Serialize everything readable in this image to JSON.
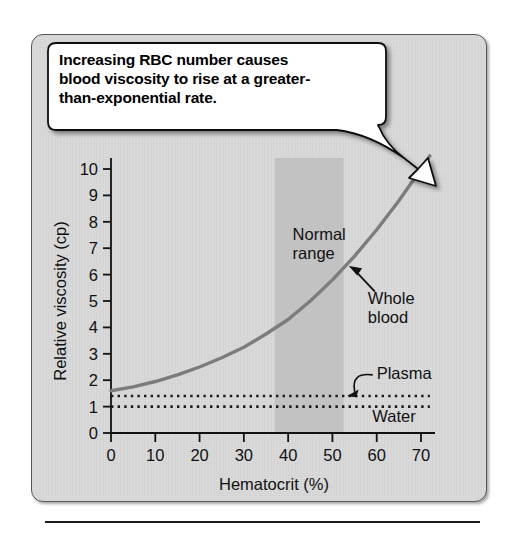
{
  "figure": {
    "callout": {
      "lines": [
        "Increasing RBC number causes",
        "blood viscosity to rise at a greater-",
        "than-exponential rate."
      ]
    }
  },
  "chart_data": {
    "type": "line",
    "title": "",
    "xlabel": "Hematocrit (%)",
    "ylabel": "Relative viscosity (cp)",
    "xlim": [
      0,
      72
    ],
    "ylim": [
      0,
      10
    ],
    "xticks": [
      0,
      10,
      20,
      30,
      40,
      50,
      60,
      70
    ],
    "xtick_labels": [
      "0",
      "10",
      "20",
      "30",
      "40",
      "50",
      "60",
      "70"
    ],
    "yticks": [
      0,
      1,
      2,
      3,
      4,
      5,
      6,
      7,
      8,
      9,
      10
    ],
    "ytick_labels": [
      "0",
      "1",
      "2",
      "3",
      "4",
      "5",
      "6",
      "7",
      "8",
      "9",
      "10"
    ],
    "grid": false,
    "legend_position": "inline-annotations",
    "series": [
      {
        "name": "Whole blood",
        "style": "solid",
        "color": "#7c7c7c",
        "x": [
          0,
          5,
          10,
          15,
          20,
          25,
          30,
          35,
          40,
          45,
          50,
          55,
          60,
          65,
          70,
          72
        ],
        "y": [
          1.6,
          1.75,
          1.95,
          2.2,
          2.5,
          2.85,
          3.25,
          3.75,
          4.3,
          5.0,
          5.8,
          6.7,
          7.7,
          8.8,
          10.0,
          10.5
        ]
      },
      {
        "name": "Plasma",
        "style": "dotted",
        "color": "#1a1a1a",
        "x": [
          0,
          72
        ],
        "y": [
          1.4,
          1.4
        ]
      },
      {
        "name": "Water",
        "style": "dotted",
        "color": "#1a1a1a",
        "x": [
          0,
          72
        ],
        "y": [
          1.0,
          1.0
        ]
      }
    ],
    "annotations": [
      {
        "text": "Normal range",
        "lines": [
          "Normal",
          "range"
        ],
        "x": 41,
        "y": 7.3
      },
      {
        "text": "Whole blood",
        "lines": [
          "Whole",
          "blood"
        ],
        "x": 58,
        "y": 4.9,
        "arrow_to_x": 54,
        "arrow_to_y": 6.3
      },
      {
        "text": "Plasma",
        "lines": [
          "Plasma"
        ],
        "x": 60,
        "y": 2.05,
        "arrow_to_x": 53,
        "arrow_to_y": 1.45
      },
      {
        "text": "Water",
        "lines": [
          "Water"
        ],
        "x": 59,
        "y": 0.42
      }
    ],
    "shaded_region": {
      "label": "Normal range",
      "x_start": 37,
      "x_end": 52.5,
      "color": "#c2c2c2"
    }
  }
}
